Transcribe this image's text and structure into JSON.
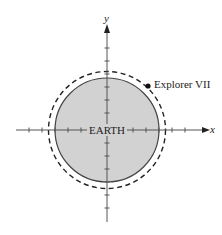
{
  "diagram": {
    "labels": {
      "x_axis": "x",
      "y_axis": "y",
      "earth": "EARTH",
      "satellite": "Explorer VII"
    },
    "colors": {
      "earth_fill": "#d2d2d2",
      "stroke": "#333333",
      "background": "#ffffff"
    },
    "geometry": {
      "center": [
        107,
        130
      ],
      "earth_radius_px": 52,
      "orbit_radius_px": 58,
      "tick_spacing_px": 13,
      "satellite_position_px": [
        148,
        86
      ]
    }
  }
}
